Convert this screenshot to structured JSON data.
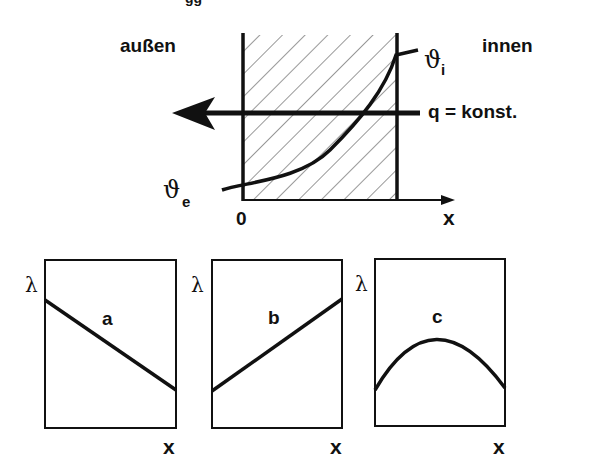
{
  "top_diagram": {
    "label_outside": "außen",
    "label_inside": "innen",
    "theta_outer": "ϑ",
    "theta_outer_sub": "e",
    "theta_inner": "ϑ",
    "theta_inner_sub": "i",
    "heat_flux_label": "q = konst.",
    "origin_label": "0",
    "x_axis_label": "x",
    "cropped_top_text": "gg"
  },
  "panels": [
    {
      "id": "a",
      "label": "a",
      "y_label": "λ",
      "x_label": "x",
      "shape": "decreasing linear"
    },
    {
      "id": "b",
      "label": "b",
      "y_label": "λ",
      "x_label": "x",
      "shape": "increasing linear"
    },
    {
      "id": "c",
      "label": "c",
      "y_label": "λ",
      "x_label": "x",
      "shape": "concave parabola (maximum)"
    }
  ]
}
